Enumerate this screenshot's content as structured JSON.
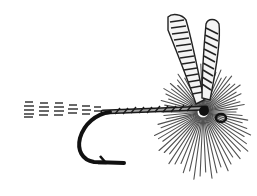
{
  "image": {
    "subject": "Dry fly fishing fly illustration",
    "style": "black and white engraving",
    "colors": {
      "background": "#ffffff",
      "ink": "#1a1a1a",
      "ink_light": "#555555"
    },
    "parts": [
      "tail",
      "hook-shank",
      "hook-bend",
      "hook-barb",
      "wing-left",
      "wing-right",
      "hackle",
      "hook-eye"
    ]
  }
}
